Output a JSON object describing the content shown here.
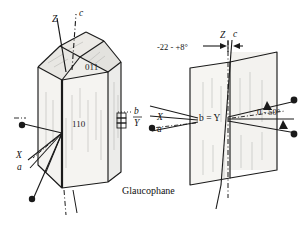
{
  "figure": {
    "caption": "Glaucophane",
    "left_crystal": {
      "axis_label_z": "Z",
      "axis_label_c": "c",
      "face_label_upper": "011",
      "face_label_side": "110",
      "axis_label_b": "b",
      "axis_label_Y": "Y",
      "axis_label_X": "X",
      "axis_label_a": "a"
    },
    "right_section": {
      "axis_label_Z": "Z",
      "axis_label_c": "c",
      "extinction_angle_top": "-22 - +8°",
      "axis_label_bY": "b = Y",
      "axis_label_X": "X",
      "axis_label_a": "a",
      "extinction_angle_right": "0 - 50°"
    },
    "colors": {
      "stroke": "#1a1a1a",
      "light_stroke": "#8a8a8a",
      "face_fill": "#f2f1ee",
      "top_face_fill": "#e9e8e4",
      "background": "#ffffff"
    }
  }
}
